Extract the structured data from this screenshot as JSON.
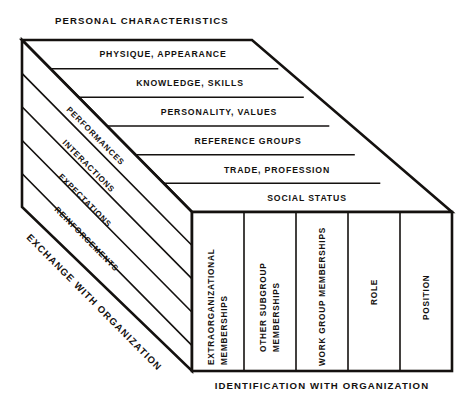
{
  "figure": {
    "kind": "isometric-block-diagram",
    "top_title": "PERSONAL CHARACTERISTICS",
    "bottom_title": "IDENTIFICATION  WITH  ORGANIZATION",
    "side_title": "EXCHANGE  WITH  ORGANIZATION",
    "ink_color": "#14110f",
    "paper_color": "#ffffff"
  },
  "top_face": {
    "axis_label": "PERSONAL CHARACTERISTICS",
    "rows": [
      {
        "label": "PHYSIQUE, APPEARANCE"
      },
      {
        "label": "KNOWLEDGE, SKILLS"
      },
      {
        "label": "PERSONALITY, VALUES"
      },
      {
        "label": "REFERENCE GROUPS"
      },
      {
        "label": "TRADE, PROFESSION"
      },
      {
        "label": "SOCIAL STATUS"
      }
    ]
  },
  "left_face": {
    "axis_label": "EXCHANGE  WITH  ORGANIZATION",
    "rows": [
      {
        "label": "PERFORMANCES"
      },
      {
        "label": "INTERACTIONS"
      },
      {
        "label": "EXPECTATIONS"
      },
      {
        "label": "REINFORCEMENTS"
      }
    ]
  },
  "front_face": {
    "axis_label": "IDENTIFICATION  WITH  ORGANIZATION",
    "columns": [
      {
        "label": "EXTRAORGANIZATIONAL MEMBERSHIPS",
        "line1": "EXTRAORGANIZATIONAL",
        "line2": "MEMBERSHIPS"
      },
      {
        "label": "OTHER SUBGROUP MEMBERSHIPS",
        "line1": "OTHER SUBGROUP",
        "line2": "MEMBERSHIPS"
      },
      {
        "label": "WORK GROUP MEMBERSHIPS",
        "line1": "WORK GROUP MEMBERSHIPS",
        "line2": ""
      },
      {
        "label": "ROLE",
        "line1": "ROLE",
        "line2": ""
      },
      {
        "label": "POSITION",
        "line1": "POSITION",
        "line2": ""
      }
    ]
  }
}
